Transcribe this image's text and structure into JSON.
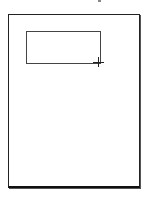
{
  "canvas": {
    "page": {
      "background": "#ffffff",
      "border_color": "#222222"
    },
    "selection_rectangle": {
      "x": 26,
      "y": 31,
      "width": 73,
      "height": 31,
      "stroke": "#444444"
    },
    "cursor": {
      "type": "crosshair-icon",
      "x": 98,
      "y": 62
    }
  }
}
